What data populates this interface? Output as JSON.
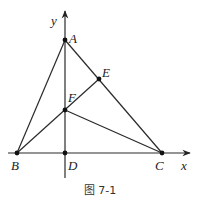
{
  "figure": {
    "caption": "图 7-1",
    "axes": {
      "x_label": "x",
      "y_label": "y"
    },
    "points": {
      "A": {
        "label": "A",
        "x": 65,
        "y": 40
      },
      "B": {
        "label": "B",
        "x": 17,
        "y": 153
      },
      "C": {
        "label": "C",
        "x": 162,
        "y": 153
      },
      "D": {
        "label": "D",
        "x": 65,
        "y": 153
      },
      "E": {
        "label": "E",
        "x": 99,
        "y": 79
      },
      "F": {
        "label": "F",
        "x": 65,
        "y": 110
      }
    },
    "segments": [
      "AB",
      "AC",
      "BE",
      "FC",
      "AD",
      "BC"
    ],
    "colors": {
      "line": "#2a2a2a",
      "point": "#111111",
      "background": "#ffffff"
    }
  }
}
